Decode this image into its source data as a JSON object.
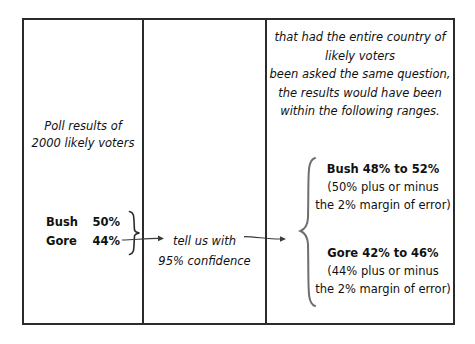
{
  "diagram": {
    "panels": {
      "poll": {
        "caption_line1": "Poll results of",
        "caption_line2": "2000 likely voters",
        "figures": [
          {
            "candidate": "Bush",
            "value": "50%"
          },
          {
            "candidate": "Gore",
            "value": "44%"
          }
        ],
        "brace_icon": "right-curly-brace-icon"
      },
      "inference": {
        "line1": "tell us with",
        "line2": "95% confidence",
        "arrow_in_icon": "arrow-right-icon",
        "arrow_out_icon": "arrow-right-icon"
      },
      "ranges": {
        "intro": [
          "that had the entire country of",
          "likely voters",
          "been asked the same question,",
          "the results would have been",
          "within the following ranges."
        ],
        "brace_icon": "left-curly-brace-icon",
        "results": [
          {
            "heading": "Bush 48% to 52%",
            "sub_line1": "(50% plus or minus",
            "sub_line2": "the 2% margin of error)"
          },
          {
            "heading": "Gore 42% to 46%",
            "sub_line1": "(44% plus or minus",
            "sub_line2": "the 2% margin of error)"
          }
        ]
      }
    },
    "colors": {
      "ink": "#111111",
      "frame": "#2b2b2b",
      "background": "#ffffff"
    }
  }
}
